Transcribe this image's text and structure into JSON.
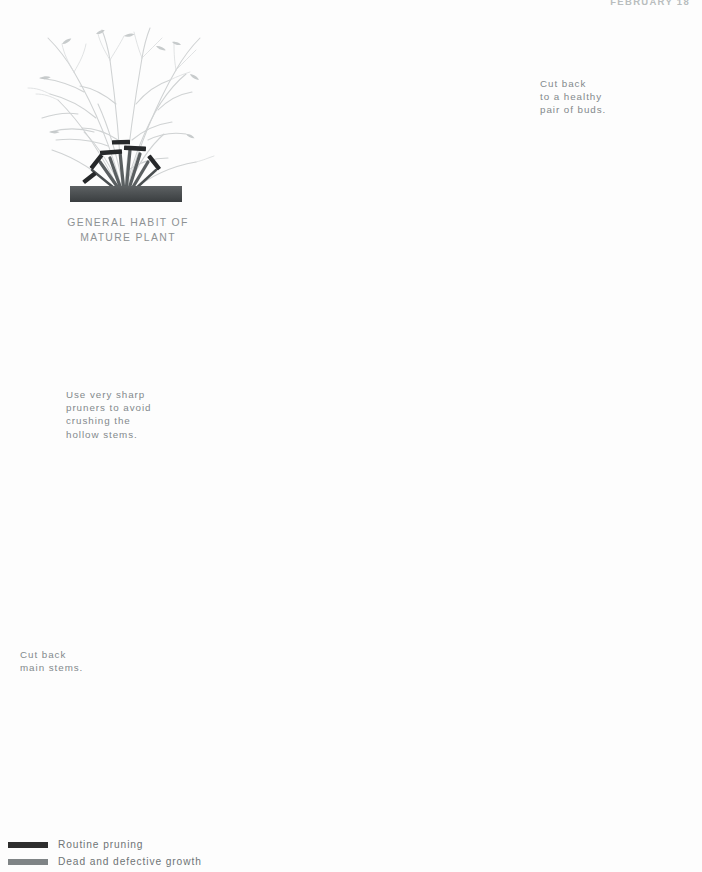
{
  "page": {
    "running_head": "FEBRUARY 18",
    "background_color": "#fdfdfd",
    "width": 702,
    "height": 872
  },
  "habit_diagram": {
    "label": "GENERAL HABIT OF\nMATURE PLANT"
  },
  "callouts": [
    {
      "id": "cut-back-buds",
      "icon": "pruner-secateurs-icon",
      "text": "Cut back\nto a healthy\npair of buds."
    },
    {
      "id": "sharp-pruners",
      "icon": "pruner-blade-on-stem-icon",
      "text": "Use very sharp\npruners to avoid\ncrushing the\nhollow stems."
    },
    {
      "id": "cut-back-main-stems",
      "icon": "bypass-pruner-icon",
      "text": "Cut back\nmain stems."
    }
  ],
  "legend": {
    "items": [
      {
        "label": "Routine pruning",
        "color": "#2e2e2e"
      },
      {
        "label": "Dead and defective growth",
        "color": "#7f8486"
      }
    ]
  },
  "colors": {
    "branch_light": "#c9cccd",
    "branch_mid": "#b6babb",
    "stem_dark": "#55595b",
    "stem_darker": "#3f4446",
    "cut_mark": "#26282a",
    "soil": "#4b4f51",
    "circle_ring": "#b9bdbe",
    "caption_text": "#83898c",
    "tool_metal": "#c3c7c8",
    "tool_shadow": "#8d9294",
    "tool_handle": "#4e5355"
  }
}
